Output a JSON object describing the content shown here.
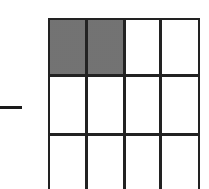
{
  "diagram": {
    "minus_sign": "−",
    "grid": {
      "columns": 4,
      "visible_rows": 3,
      "shaded_cells": [
        [
          0,
          0
        ],
        [
          0,
          1
        ]
      ],
      "shade_color": "#888888",
      "line_color": "#222222"
    }
  }
}
